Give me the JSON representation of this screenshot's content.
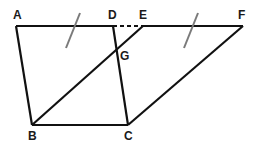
{
  "diagram": {
    "type": "geometry",
    "points": {
      "A": {
        "label": "A",
        "x": 16,
        "y": 26
      },
      "D": {
        "label": "D",
        "x": 113,
        "y": 26
      },
      "E": {
        "label": "E",
        "x": 143,
        "y": 26
      },
      "F": {
        "label": "F",
        "x": 243,
        "y": 26
      },
      "G": {
        "label": "G",
        "x": 117,
        "y": 52
      },
      "B": {
        "label": "B",
        "x": 32,
        "y": 125
      },
      "C": {
        "label": "C",
        "x": 128,
        "y": 125
      }
    },
    "segments": [
      {
        "from": "A",
        "to": "D",
        "style": "solid"
      },
      {
        "from": "D",
        "to": "E",
        "style": "dashed"
      },
      {
        "from": "E",
        "to": "F",
        "style": "solid"
      },
      {
        "from": "A",
        "to": "B",
        "style": "solid"
      },
      {
        "from": "B",
        "to": "C",
        "style": "solid"
      },
      {
        "from": "C",
        "to": "D",
        "style": "solid"
      },
      {
        "from": "B",
        "to": "E",
        "style": "solid"
      },
      {
        "from": "C",
        "to": "F",
        "style": "solid"
      }
    ],
    "tick_marks": [
      {
        "on": "AD",
        "meaning": "equal-length"
      },
      {
        "on": "EF",
        "meaning": "equal-length"
      }
    ],
    "colors": {
      "line": "#111111",
      "tick": "#7a7a7a"
    }
  }
}
